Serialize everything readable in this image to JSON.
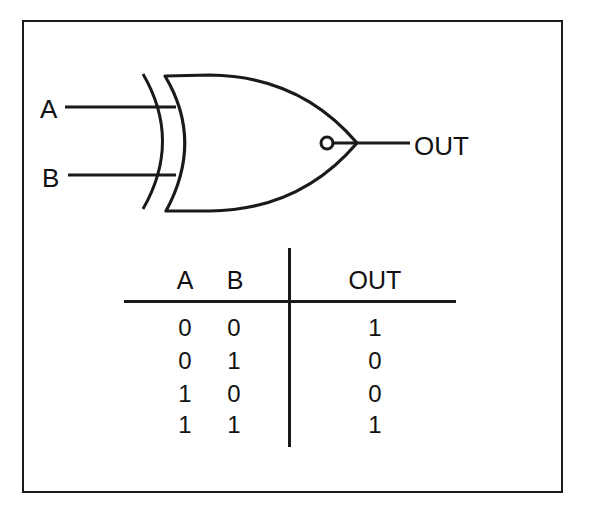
{
  "diagram": {
    "type": "logic-gate",
    "gate": "XNOR",
    "inputs": [
      {
        "label": "A"
      },
      {
        "label": "B"
      }
    ],
    "output": {
      "label": "OUT"
    }
  },
  "truth_table": {
    "headers": {
      "a": "A",
      "b": "B",
      "out": "OUT"
    },
    "rows": [
      {
        "a": "0",
        "b": "0",
        "out": "1"
      },
      {
        "a": "0",
        "b": "1",
        "out": "0"
      },
      {
        "a": "1",
        "b": "0",
        "out": "0"
      },
      {
        "a": "1",
        "b": "1",
        "out": "1"
      }
    ]
  }
}
